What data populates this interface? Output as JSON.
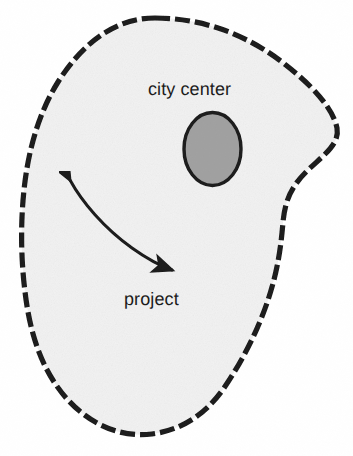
{
  "figure": {
    "type": "schematic-map",
    "title_visible": false,
    "background_color": "#ffffff",
    "labels": [
      {
        "id": "city-center",
        "text": "city center"
      },
      {
        "id": "project",
        "text": "project"
      }
    ],
    "regions": [
      {
        "name": "city-boundary",
        "shape": "irregular-blob",
        "fill_color": "#f2f2f2",
        "stroke_color": "#1a1a1a",
        "stroke_style": "dashed",
        "stroke_width": 5
      },
      {
        "name": "city-center-zone",
        "shape": "ellipse",
        "fill_color": "#a0a0a0",
        "stroke_color": "#1a1a1a",
        "stroke_width": 3
      }
    ],
    "connectors": [
      {
        "name": "project-arrow",
        "style": "curved",
        "heads": "double",
        "stroke_color": "#1a1a1a",
        "stroke_width": 3,
        "label": "project"
      }
    ]
  },
  "palette": {
    "ink": "#1a1a1a",
    "region_fill": "#f2f2f2",
    "center_fill": "#a0a0a0",
    "page": "#ffffff"
  }
}
